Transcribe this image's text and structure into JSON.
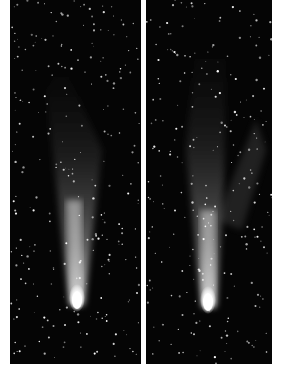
{
  "image": {
    "description": "Two side-by-side astronomical photographs of a comet with a bright nucleus and a long faint tail against a star field",
    "panels": [
      {
        "id": "left",
        "subject": "comet with narrow tail",
        "nucleus_x": 67,
        "nucleus_y": 305
      },
      {
        "id": "right",
        "subject": "comet with broader forked tail",
        "nucleus_x": 62,
        "nucleus_y": 307
      }
    ],
    "colors": {
      "sky": "#050505",
      "border": "#ffffff",
      "nucleus": "#ffffff",
      "tail": "#8a8a8a"
    }
  }
}
